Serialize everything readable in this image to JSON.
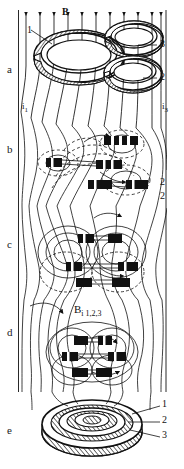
{
  "figure": {
    "type": "scientific-diagram",
    "background_color": "#ffffff",
    "ink_color": "#111111",
    "field_label": "B",
    "panels": [
      {
        "letter": "a",
        "caption_letter": "a",
        "stage": "separate rings in uniform field"
      },
      {
        "letter": "b",
        "caption_letter": "b",
        "stage": "rings approach, field lines reconnect"
      },
      {
        "letter": "c",
        "caption_letter": "c",
        "stage": "rings interlock"
      },
      {
        "letter": "d",
        "caption_letter": "d",
        "stage": "rings coalesce"
      },
      {
        "letter": "e",
        "caption_letter": "e",
        "stage": "final merged nested torus"
      }
    ],
    "ring_labels": [
      "1",
      "2",
      "3"
    ],
    "current_labels": [
      {
        "text": "i",
        "sub": "1"
      },
      {
        "text": "i",
        "sub": "3"
      }
    ],
    "panel_d_label": {
      "text": "B",
      "sub": "i 1,2,3"
    },
    "panel_e_leaders": [
      "1",
      "2",
      "3"
    ],
    "panel_a_leaders": {
      "left": "1",
      "right_top": "3",
      "right_bottom": "2"
    },
    "panel_b_leaders": {
      "right_bottom": "2"
    },
    "panel_c_leaders": {
      "right_top": "2"
    }
  }
}
